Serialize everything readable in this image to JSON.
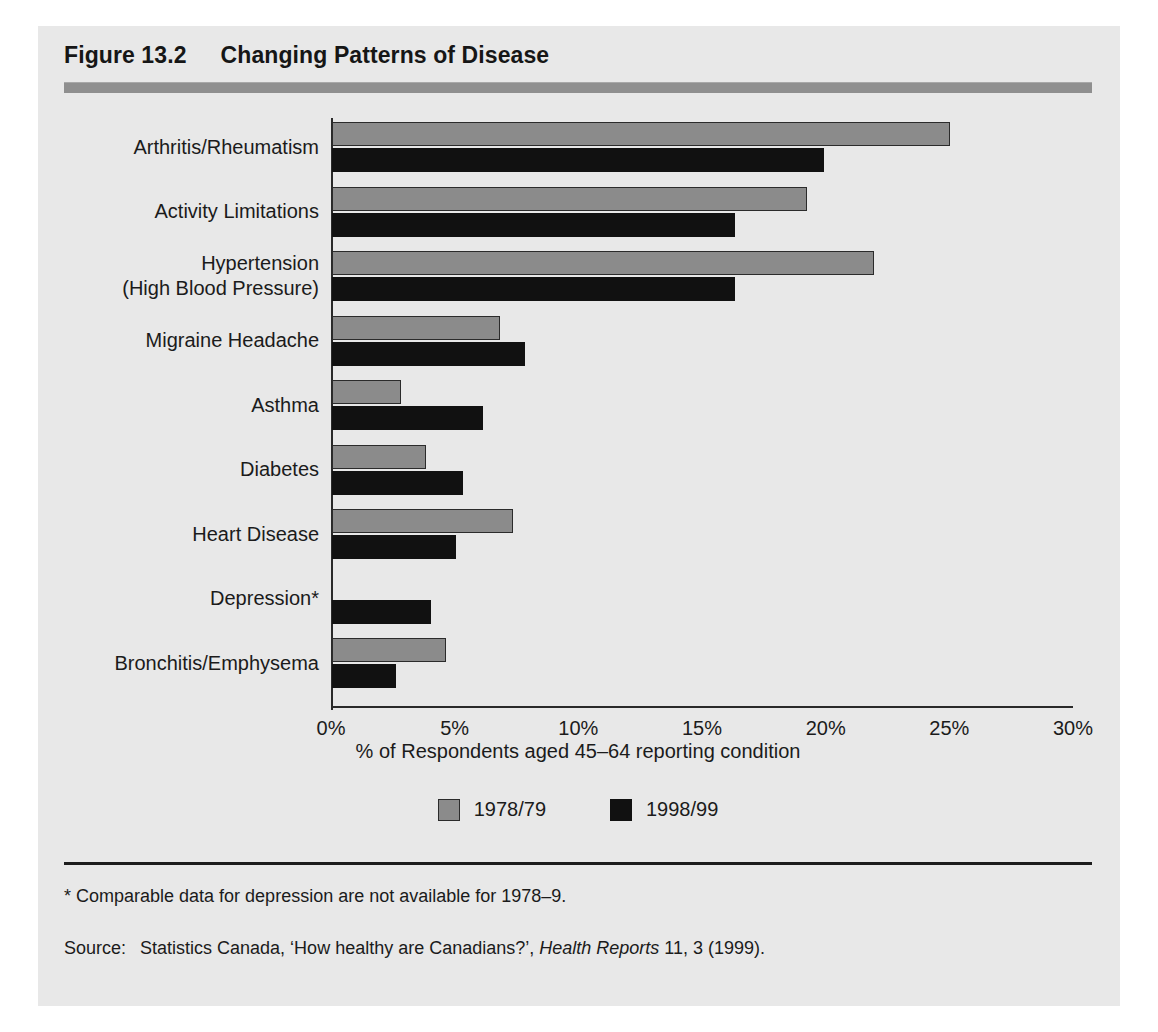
{
  "figure": {
    "number": "Figure 13.2",
    "title": "Changing Patterns of Disease"
  },
  "note": "* Comparable data for depression are not available for 1978–9.",
  "source": {
    "key": "Source:",
    "pre": "Statistics Canada, ‘How healthy are Canadians?’, ",
    "italic": "Health Reports",
    "post": " 11, 3 (1999)."
  },
  "colors": {
    "series_1978": "#8b8b8b",
    "series_1998": "#111111",
    "panel_background": "#e8e8e8",
    "header_rule": "#8f8f8f",
    "axis": "#2a2a2a"
  },
  "chart_data": {
    "type": "bar",
    "orientation": "horizontal",
    "title": "Changing Patterns of Disease",
    "xlabel": "% of Respondents aged 45–64 reporting condition",
    "ylabel": "",
    "xlim": [
      0,
      30
    ],
    "xticks": [
      0,
      5,
      10,
      15,
      20,
      25,
      30
    ],
    "xtick_labels": [
      "0%",
      "5%",
      "10%",
      "15%",
      "20%",
      "25%",
      "30%"
    ],
    "grid": false,
    "legend_position": "bottom",
    "categories": [
      "Arthritis/Rheumatism",
      "Activity Limitations",
      "Hypertension\n(High Blood Pressure)",
      "Migraine Headache",
      "Asthma",
      "Diabetes",
      "Heart Disease",
      "Depression*",
      "Bronchitis/Emphysema"
    ],
    "series": [
      {
        "name": "1978/79",
        "color": "#8b8b8b",
        "values": [
          25.0,
          19.2,
          21.9,
          6.8,
          2.8,
          3.8,
          7.3,
          null,
          4.6
        ]
      },
      {
        "name": "1998/99",
        "color": "#111111",
        "values": [
          19.9,
          16.3,
          16.3,
          7.8,
          6.1,
          5.3,
          5.0,
          4.0,
          2.6
        ]
      }
    ]
  }
}
